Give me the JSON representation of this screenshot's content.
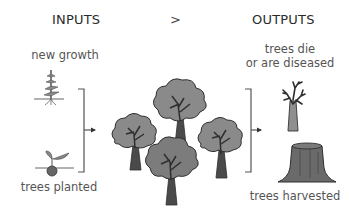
{
  "headers": {
    "inputs": "INPUTS",
    "separator": ">",
    "outputs": "OUTPUTS"
  },
  "inputs": [
    {
      "label": "new growth",
      "icon": "plant-sprout-icon"
    },
    {
      "label": "trees planted",
      "icon": "seed-sprouting-icon"
    }
  ],
  "center": {
    "icon": "forest-trees-icon",
    "tree_count": 4
  },
  "outputs": [
    {
      "label_line1": "trees die",
      "label_line2": "or are diseased",
      "icon": "dead-tree-icon"
    },
    {
      "label": "trees harvested",
      "icon": "tree-stump-icon"
    }
  ],
  "colors": {
    "canopy": "#8a8a8a",
    "canopy_dark": "#6f6f6f",
    "trunk": "#4a4a4a",
    "outline": "#2e2e2e",
    "bracket": "#555555"
  }
}
